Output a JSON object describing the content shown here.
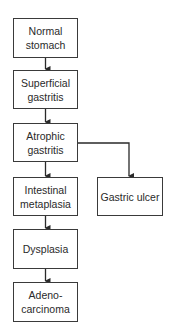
{
  "diagram": {
    "type": "flowchart",
    "title": "",
    "nodes": [
      {
        "id": "normal_stomach",
        "label": "Normal\nstomach"
      },
      {
        "id": "superficial_gastritis",
        "label": "Superficial\ngastritis"
      },
      {
        "id": "atrophic_gastritis",
        "label": "Atrophic\ngastritis"
      },
      {
        "id": "intestinal_metaplasia",
        "label": "Intestinal\nmetaplasia"
      },
      {
        "id": "dysplasia",
        "label": "Dysplasia"
      },
      {
        "id": "adenocarcinoma",
        "label": "Adeno-\ncarcinoma"
      },
      {
        "id": "gastric_ulcer",
        "label": "Gastric ulcer"
      }
    ],
    "edges": [
      {
        "from": "normal_stomach",
        "to": "superficial_gastritis"
      },
      {
        "from": "superficial_gastritis",
        "to": "atrophic_gastritis"
      },
      {
        "from": "atrophic_gastritis",
        "to": "intestinal_metaplasia"
      },
      {
        "from": "atrophic_gastritis",
        "to": "gastric_ulcer"
      },
      {
        "from": "intestinal_metaplasia",
        "to": "dysplasia"
      },
      {
        "from": "dysplasia",
        "to": "adenocarcinoma"
      }
    ],
    "colors": {
      "line": "#2a2a2a",
      "box_border": "#3a3a3a",
      "background": "#ffffff"
    }
  }
}
